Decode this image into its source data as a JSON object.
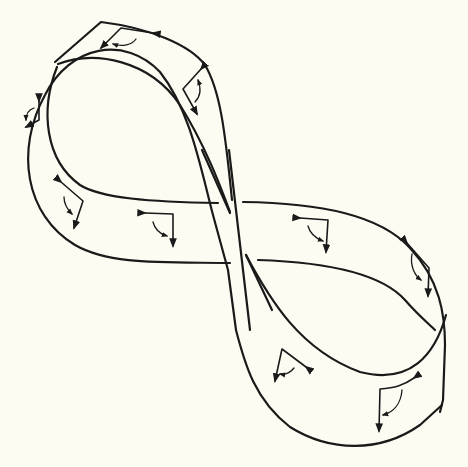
{
  "figure": {
    "ink_color": "#1a1a1a",
    "background_color": "#fdfcf3",
    "markers": [
      {
        "id": 1,
        "loop": "upper-left",
        "position": "top edge",
        "x": 118,
        "y": 33
      },
      {
        "id": 2,
        "loop": "upper-left",
        "position": "right side",
        "x": 192,
        "y": 85
      },
      {
        "id": 3,
        "loop": "upper-left",
        "position": "left side",
        "x": 32,
        "y": 115
      },
      {
        "id": 4,
        "loop": "upper-left",
        "position": "lower left",
        "x": 72,
        "y": 203
      },
      {
        "id": 5,
        "loop": "center-left",
        "position": "band before crossing",
        "x": 160,
        "y": 225
      },
      {
        "id": 6,
        "loop": "center-right",
        "position": "band after crossing",
        "x": 305,
        "y": 230
      },
      {
        "id": 7,
        "loop": "lower-right",
        "position": "right side",
        "x": 418,
        "y": 262
      },
      {
        "id": 8,
        "loop": "lower-right",
        "position": "lower left",
        "x": 285,
        "y": 365
      },
      {
        "id": 9,
        "loop": "lower-right",
        "position": "bottom",
        "x": 390,
        "y": 400
      }
    ]
  }
}
